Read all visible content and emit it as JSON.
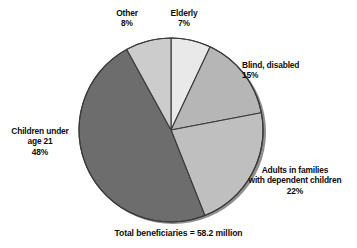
{
  "chart_data": {
    "type": "pie",
    "title": "",
    "subtitle": "",
    "xlabel": "",
    "ylabel": "",
    "legend_position": "callout-labels",
    "grid": false,
    "units": "percent of total beneficiaries",
    "footnote": "Total beneficiaries = 58.2 million",
    "total_label": "Total beneficiaries",
    "total_value": "58.2 million",
    "start_angle_deg": 0,
    "direction": "clockwise",
    "categories": [
      "Elderly",
      "Blind, disabled",
      "Adults in families with dependent children",
      "Children under age 21",
      "Other"
    ],
    "values": [
      7,
      15,
      22,
      48,
      8
    ],
    "slices": [
      {
        "key": "elderly",
        "label": "Elderly",
        "label_lines": [
          "Elderly"
        ],
        "value": 7,
        "value_label": "7%",
        "color": "#e9e9e9",
        "start_deg": 0,
        "end_deg": 25.2
      },
      {
        "key": "blind-disabled",
        "label": "Blind, disabled",
        "label_lines": [
          "Blind, disabled"
        ],
        "value": 15,
        "value_label": "15%",
        "color": "#b6b6b6",
        "start_deg": 25.2,
        "end_deg": 79.2
      },
      {
        "key": "adults-dependent-children",
        "label": "Adults in families with dependent children",
        "label_lines": [
          "Adults in families",
          "with dependent children"
        ],
        "value": 22,
        "value_label": "22%",
        "color": "#bfbfbf",
        "start_deg": 79.2,
        "end_deg": 158.4
      },
      {
        "key": "children-under-21",
        "label": "Children under age 21",
        "label_lines": [
          "Children under",
          "age 21"
        ],
        "value": 48,
        "value_label": "48%",
        "color": "#6d6d6d",
        "start_deg": 158.4,
        "end_deg": 331.2
      },
      {
        "key": "other",
        "label": "Other",
        "label_lines": [
          "Other"
        ],
        "value": 8,
        "value_label": "8%",
        "color": "#cccccc",
        "start_deg": 331.2,
        "end_deg": 360
      }
    ]
  },
  "colors": {
    "background": "#ffffff",
    "text": "#0d0d0d",
    "outline": "#3a3a3a",
    "shadow": "#8f8f8f"
  }
}
